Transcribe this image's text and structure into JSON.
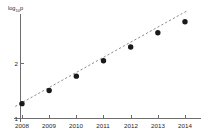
{
  "chart_data": {
    "type": "scatter",
    "title": "",
    "xlabel": "",
    "ylabel": "log10 p",
    "ylabel_base": "log",
    "ylabel_subscript": "10",
    "ylabel_variable": "p",
    "categories": [
      "2008",
      "2009",
      "2010",
      "2011",
      "2012",
      "2013",
      "2014"
    ],
    "x": [
      2008,
      2009,
      2010,
      2011,
      2012,
      2013,
      2014
    ],
    "values": [
      1.27,
      1.51,
      1.77,
      2.05,
      2.3,
      2.56,
      2.76
    ],
    "xtick_labels": [
      "2008",
      "2009",
      "2010",
      "2011",
      "2012",
      "2013",
      "2014"
    ],
    "ytick_labels": [
      "1",
      "2"
    ],
    "ytick_values": [
      1,
      2
    ],
    "xlim": [
      2007.6,
      2014.6
    ],
    "ylim": [
      1.0,
      3.05
    ],
    "grid": false,
    "legend": false,
    "legend_position": "none",
    "marker_style": "filled-circle",
    "marker_color": "#1a1a1a",
    "series": [
      {
        "name": "observed",
        "type": "scatter",
        "values": [
          1.27,
          1.51,
          1.77,
          2.05,
          2.3,
          2.56,
          2.76
        ]
      },
      {
        "name": "linear-fit",
        "type": "line",
        "style": "dashed",
        "color": "#8a8a8a",
        "x_endpoints": [
          2007.75,
          2014.05
        ],
        "y_endpoints": [
          1.22,
          2.95
        ]
      }
    ],
    "annotations": []
  },
  "colors": {
    "background": "#ffffff",
    "axis": "#6e6e6e",
    "marker": "#1a1a1a",
    "fit_line": "#8a8a8a",
    "text": "#262626"
  }
}
